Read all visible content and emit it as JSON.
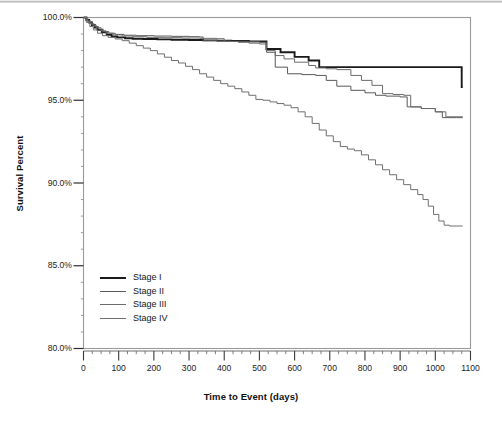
{
  "chart_data": {
    "type": "line",
    "subtype": "kaplan-meier-survival-step",
    "title": "",
    "xlabel": "Time to Event (days)",
    "ylabel": "Survival Percent",
    "xlim": [
      0,
      1100
    ],
    "ylim": [
      80.0,
      100.0
    ],
    "xticks": [
      0,
      100,
      200,
      300,
      400,
      500,
      600,
      700,
      800,
      900,
      1000,
      1100
    ],
    "xtick_labels": [
      "0",
      "100",
      "200",
      "300",
      "400",
      "500",
      "600",
      "700",
      "800",
      "900",
      "1000",
      "1100"
    ],
    "yticks": [
      80.0,
      85.0,
      90.0,
      95.0,
      100.0
    ],
    "ytick_labels": [
      "80.0%",
      "85.0%",
      "90.0%",
      "95.0%",
      "100.0%"
    ],
    "x_minor_tick_interval": 25,
    "y_minor_tick_interval": 1,
    "grid": false,
    "legend_position": "lower-left-inside",
    "frame_color": "#9a9a9a",
    "series": [
      {
        "name": "Stage I",
        "color": "#1a1a1a",
        "line_width": 1.9,
        "final_value": 95.8,
        "points": [
          [
            0,
            100.0
          ],
          [
            8,
            99.85
          ],
          [
            16,
            99.7
          ],
          [
            24,
            99.55
          ],
          [
            32,
            99.4
          ],
          [
            40,
            99.25
          ],
          [
            52,
            99.1
          ],
          [
            66,
            98.95
          ],
          [
            80,
            98.85
          ],
          [
            96,
            98.8
          ],
          [
            118,
            98.75
          ],
          [
            140,
            98.72
          ],
          [
            170,
            98.7
          ],
          [
            210,
            98.68
          ],
          [
            250,
            98.66
          ],
          [
            300,
            98.64
          ],
          [
            340,
            98.62
          ],
          [
            380,
            98.6
          ],
          [
            420,
            98.58
          ],
          [
            470,
            98.56
          ],
          [
            520,
            98.1
          ],
          [
            560,
            97.9
          ],
          [
            600,
            97.62
          ],
          [
            640,
            97.4
          ],
          [
            670,
            97.0
          ],
          [
            760,
            97.0
          ],
          [
            860,
            97.0
          ],
          [
            960,
            97.0
          ],
          [
            1040,
            97.0
          ],
          [
            1072,
            97.0
          ],
          [
            1075,
            95.8
          ],
          [
            1078,
            95.8
          ]
        ]
      },
      {
        "name": "Stage II",
        "color": "#595959",
        "line_width": 1.0,
        "final_value": 94.0,
        "points": [
          [
            0,
            100.0
          ],
          [
            10,
            99.8
          ],
          [
            20,
            99.62
          ],
          [
            30,
            99.45
          ],
          [
            42,
            99.3
          ],
          [
            56,
            99.15
          ],
          [
            72,
            99.05
          ],
          [
            90,
            98.98
          ],
          [
            115,
            98.93
          ],
          [
            150,
            98.9
          ],
          [
            200,
            98.88
          ],
          [
            250,
            98.86
          ],
          [
            300,
            98.84
          ],
          [
            330,
            98.82
          ],
          [
            340,
            98.6
          ],
          [
            380,
            98.58
          ],
          [
            420,
            98.56
          ],
          [
            470,
            98.54
          ],
          [
            500,
            98.5
          ],
          [
            520,
            97.9
          ],
          [
            545,
            97.0
          ],
          [
            580,
            96.6
          ],
          [
            620,
            96.55
          ],
          [
            660,
            96.5
          ],
          [
            690,
            96.2
          ],
          [
            720,
            95.85
          ],
          [
            760,
            95.6
          ],
          [
            800,
            95.45
          ],
          [
            830,
            95.3
          ],
          [
            860,
            95.25
          ],
          [
            900,
            95.2
          ],
          [
            920,
            94.6
          ],
          [
            960,
            94.5
          ],
          [
            1000,
            94.3
          ],
          [
            1020,
            93.95
          ],
          [
            1060,
            93.95
          ],
          [
            1078,
            93.95
          ]
        ]
      },
      {
        "name": "Stage III",
        "color": "#6b6b6b",
        "line_width": 1.0,
        "final_value": 94.0,
        "points": [
          [
            0,
            100.0
          ],
          [
            12,
            99.75
          ],
          [
            24,
            99.55
          ],
          [
            36,
            99.38
          ],
          [
            50,
            99.2
          ],
          [
            64,
            99.05
          ],
          [
            84,
            98.95
          ],
          [
            110,
            98.88
          ],
          [
            140,
            98.84
          ],
          [
            180,
            98.8
          ],
          [
            230,
            98.78
          ],
          [
            280,
            98.76
          ],
          [
            330,
            98.74
          ],
          [
            380,
            98.72
          ],
          [
            400,
            98.55
          ],
          [
            440,
            98.5
          ],
          [
            470,
            98.45
          ],
          [
            500,
            98.4
          ],
          [
            520,
            98.0
          ],
          [
            545,
            97.7
          ],
          [
            570,
            97.5
          ],
          [
            600,
            97.3
          ],
          [
            640,
            97.1
          ],
          [
            660,
            96.95
          ],
          [
            690,
            96.9
          ],
          [
            720,
            96.85
          ],
          [
            760,
            96.5
          ],
          [
            790,
            96.2
          ],
          [
            820,
            95.9
          ],
          [
            850,
            95.4
          ],
          [
            880,
            95.35
          ],
          [
            910,
            95.3
          ],
          [
            930,
            94.6
          ],
          [
            960,
            94.5
          ],
          [
            1000,
            94.3
          ],
          [
            1030,
            94.0
          ],
          [
            1078,
            94.0
          ]
        ]
      },
      {
        "name": "Stage IV",
        "color": "#6f6f6f",
        "line_width": 1.0,
        "final_value": 87.4,
        "points": [
          [
            0,
            100.0
          ],
          [
            8,
            99.7
          ],
          [
            18,
            99.45
          ],
          [
            28,
            99.25
          ],
          [
            40,
            99.05
          ],
          [
            54,
            98.9
          ],
          [
            70,
            98.8
          ],
          [
            90,
            98.7
          ],
          [
            110,
            98.6
          ],
          [
            130,
            98.45
          ],
          [
            150,
            98.3
          ],
          [
            170,
            98.15
          ],
          [
            190,
            98.0
          ],
          [
            210,
            97.8
          ],
          [
            230,
            97.6
          ],
          [
            250,
            97.4
          ],
          [
            270,
            97.25
          ],
          [
            290,
            97.05
          ],
          [
            310,
            96.85
          ],
          [
            330,
            96.6
          ],
          [
            350,
            96.4
          ],
          [
            370,
            96.2
          ],
          [
            390,
            96.0
          ],
          [
            410,
            95.85
          ],
          [
            430,
            95.7
          ],
          [
            450,
            95.5
          ],
          [
            470,
            95.3
          ],
          [
            490,
            95.05
          ],
          [
            510,
            95.0
          ],
          [
            530,
            94.9
          ],
          [
            550,
            94.8
          ],
          [
            570,
            94.7
          ],
          [
            590,
            94.55
          ],
          [
            610,
            94.3
          ],
          [
            630,
            94.0
          ],
          [
            650,
            93.6
          ],
          [
            670,
            93.2
          ],
          [
            690,
            92.85
          ],
          [
            710,
            92.5
          ],
          [
            730,
            92.2
          ],
          [
            750,
            92.05
          ],
          [
            770,
            91.95
          ],
          [
            790,
            91.7
          ],
          [
            810,
            91.4
          ],
          [
            830,
            91.1
          ],
          [
            850,
            90.8
          ],
          [
            870,
            90.5
          ],
          [
            890,
            90.2
          ],
          [
            910,
            89.9
          ],
          [
            930,
            89.6
          ],
          [
            950,
            89.3
          ],
          [
            965,
            89.0
          ],
          [
            980,
            88.6
          ],
          [
            995,
            88.1
          ],
          [
            1010,
            87.7
          ],
          [
            1025,
            87.45
          ],
          [
            1040,
            87.4
          ],
          [
            1078,
            87.4
          ]
        ]
      }
    ]
  },
  "legend": {
    "items": [
      {
        "label": "Stage I"
      },
      {
        "label": "Stage II"
      },
      {
        "label": "Stage III"
      },
      {
        "label": "Stage IV"
      }
    ]
  }
}
